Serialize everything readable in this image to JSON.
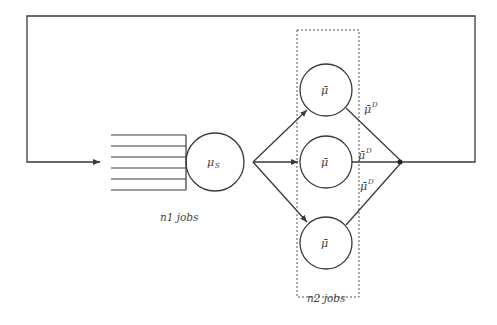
{
  "diagram": {
    "type": "queueing-network",
    "colors": {
      "line": "#3a3a3a",
      "text": "#444444",
      "background": "#ffffff"
    },
    "feedback_loop": {
      "label": ""
    },
    "queue": {
      "label": "n1 jobs",
      "lines": 6
    },
    "server_s": {
      "label": "μ",
      "subscript": "S"
    },
    "parallel_servers": {
      "label": "n2 jobs",
      "servers": [
        {
          "label": "μ̄"
        },
        {
          "label": "μ̄"
        },
        {
          "label": "μ̄"
        }
      ],
      "departure_rates": [
        {
          "label": "μ̄",
          "superscript": "D"
        },
        {
          "label": "μ̄",
          "superscript": "D"
        },
        {
          "label": "μ̄",
          "superscript": "D"
        }
      ]
    }
  }
}
